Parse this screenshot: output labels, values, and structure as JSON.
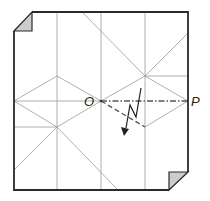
{
  "diagram": {
    "type": "origami-crease-pattern",
    "labels": {
      "o": "O",
      "p": "P"
    },
    "colors": {
      "outline": "#2a2a2a",
      "crease": "#9a9a9a",
      "fold_line": "#555555",
      "corner_fill": "#cccccc",
      "background": "#ffffff"
    },
    "points": {
      "O": [
        101,
        101
      ],
      "P": [
        188,
        101
      ],
      "upper_right_node": [
        145,
        76
      ],
      "lower_right_node": [
        145,
        127
      ],
      "upper_left_node": [
        57,
        76
      ],
      "lower_left_node": [
        57,
        127
      ]
    },
    "folded_corners": [
      "top-left",
      "bottom-right"
    ],
    "fold_lines": {
      "mountain_OP": "dash-dot from O to P",
      "valley_O_to_lower_right": "dashed from O to lower_right_node"
    },
    "arrow": "zig-zag arrow pointing down (pleat fold)"
  }
}
